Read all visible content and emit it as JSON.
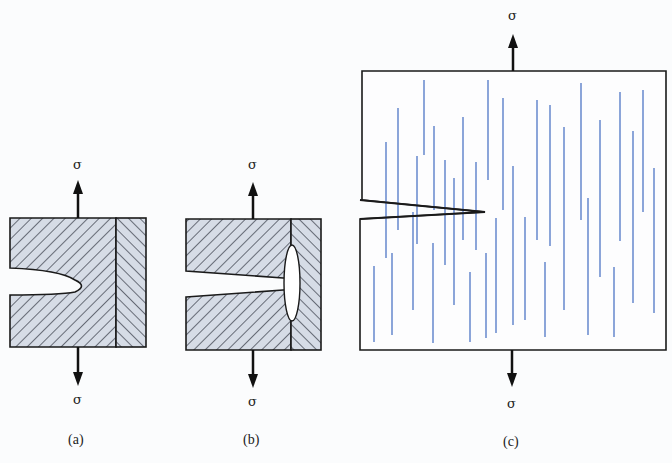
{
  "figure": {
    "panels": [
      {
        "id": "a",
        "caption": "(a)",
        "top_load": "σ",
        "bottom_load": "σ",
        "description": "notched specimen, crack tip stopped before fiber/matrix interface"
      },
      {
        "id": "b",
        "caption": "(b)",
        "top_load": "σ",
        "bottom_load": "σ",
        "description": "crack reaches interface, interface debonds (elliptical opening)"
      },
      {
        "id": "c",
        "caption": "(c)",
        "top_load": "σ",
        "bottom_load": "σ",
        "description": "notched plate with distributed aligned fibers"
      }
    ],
    "colors": {
      "outline": "#1a1a1a",
      "hatch_fill": "#d6dce6",
      "hatch_line": "#2a2f3a",
      "fiber": "#5b7fc9",
      "background": "#fbfcfd"
    }
  }
}
